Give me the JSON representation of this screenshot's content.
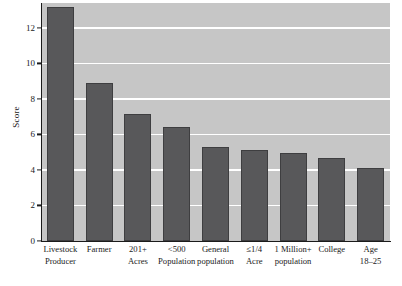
{
  "chart_data": {
    "type": "bar",
    "title": "",
    "xlabel": "",
    "ylabel": "Score",
    "ylim": [
      0,
      13.4
    ],
    "grid": true,
    "legend": null,
    "y_ticks": [
      0,
      2,
      4,
      6,
      8,
      10,
      12
    ],
    "y_tick_labels": [
      "0",
      "2",
      "4",
      "6",
      "8",
      "10",
      "12"
    ],
    "categories": [
      "Livestock Producer",
      "Farmer",
      "201+ Acres",
      "<500 Population",
      "General population",
      "≤1/4 Acre",
      "1 Million+ population",
      "College",
      "Age 18–25"
    ],
    "category_lines": [
      [
        "Livestock",
        "Producer"
      ],
      [
        "Farmer"
      ],
      [
        "201+",
        "Acres"
      ],
      [
        "<500",
        "Population"
      ],
      [
        "General",
        "population"
      ],
      [
        "≤1/4",
        "Acre"
      ],
      [
        "1 Million+",
        "population"
      ],
      [
        "College"
      ],
      [
        "Age",
        "18–25"
      ]
    ],
    "values": [
      13.2,
      8.9,
      7.15,
      6.4,
      5.3,
      5.1,
      4.95,
      4.65,
      4.1
    ],
    "bar_color": "#58585a",
    "plot_background": "#c6c6c6",
    "gridline_color": "#ffffff",
    "axis_color": "#1b1b1b"
  }
}
